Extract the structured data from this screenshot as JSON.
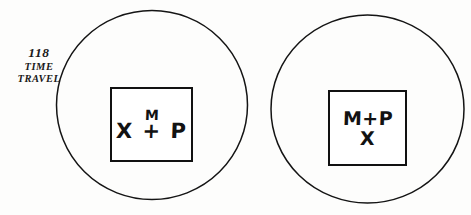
{
  "figure": {
    "background_color": "#fdfdfc",
    "ink_color": "#111111",
    "caption": {
      "number": "118",
      "line1": "TIME",
      "line2": "TRAVEL"
    },
    "panels": [
      {
        "id": "left",
        "shape": "circle",
        "box": {
          "top_text": "M",
          "bottom_text": "X + P"
        }
      },
      {
        "id": "right",
        "shape": "circle",
        "box": {
          "top_text": "M+P",
          "bottom_text": "X"
        }
      }
    ]
  }
}
